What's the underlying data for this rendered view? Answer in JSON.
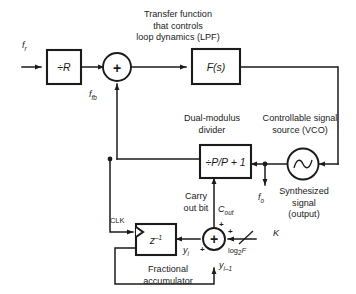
{
  "diagram": {
    "background_color": "#ffffff",
    "line_color": "#1b1b1b",
    "annotations": {
      "transfer_function_note": {
        "line1": "Transfer function",
        "line2": "that controls",
        "line3": "loop dynamics (LPF)"
      },
      "divider_note": {
        "line1": "Dual-modulus",
        "line2": "divider"
      },
      "vco_note": {
        "line1": "Controllable signal",
        "line2": "source (VCO)"
      },
      "output_note": {
        "line1": "Synthesized",
        "line2": "signal",
        "line3": "(output)"
      },
      "carry_note": {
        "line1": "Carry",
        "line2": "out bit"
      },
      "accumulator_note": {
        "line1": "Fractional",
        "line2": "accumulator"
      }
    },
    "blocks": [
      {
        "id": "reference-divider",
        "label": "÷R",
        "shape": "rectangle"
      },
      {
        "id": "loop-filter",
        "label": "F(s)",
        "shape": "rectangle"
      },
      {
        "id": "dual-modulus-divider",
        "label": "÷P/P + 1",
        "shape": "rectangle"
      },
      {
        "id": "delay-element",
        "label": "z",
        "label_exponent": "–1",
        "shape": "rectangle"
      },
      {
        "id": "phase-detector",
        "label": "+",
        "shape": "circle"
      },
      {
        "id": "accumulator-adder",
        "label": "+",
        "shape": "circle"
      },
      {
        "id": "vco",
        "label": "sine-wave",
        "shape": "circle"
      }
    ],
    "signals": [
      {
        "id": "f-ref",
        "label": "f",
        "sub": "r"
      },
      {
        "id": "f-feedback",
        "label": "f",
        "sub": "fb"
      },
      {
        "id": "f-out",
        "label": "f",
        "sub": "o"
      },
      {
        "id": "carry-out",
        "label": "C",
        "sub": "out"
      },
      {
        "id": "clock",
        "label": "CLK"
      },
      {
        "id": "accumulator-output",
        "label": "y",
        "sub": "i"
      },
      {
        "id": "accumulator-delayed",
        "label": "y",
        "sub": "i–1"
      },
      {
        "id": "bus-width",
        "label": "K"
      },
      {
        "id": "bus-width-value",
        "label": "log",
        "sub": "2",
        "tail": "F"
      }
    ],
    "sign_labels": {
      "adder_top": "+",
      "adder_left": "+",
      "adder_bottom": "+"
    }
  }
}
